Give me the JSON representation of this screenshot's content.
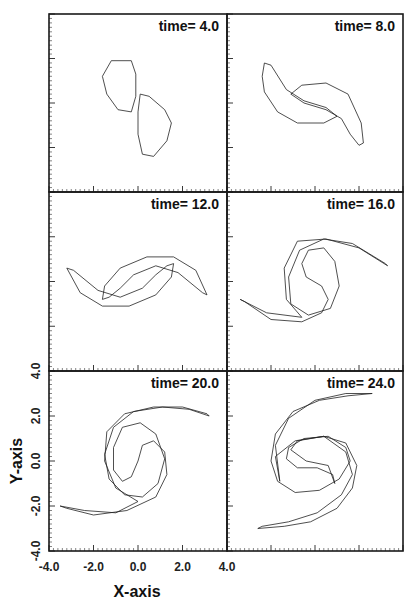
{
  "chart_data": {
    "type": "line",
    "xlabel": "X-axis",
    "ylabel": "Y-axis",
    "xlim": [
      -4.0,
      4.0
    ],
    "ylim": [
      -4.0,
      4.0
    ],
    "x_ticks": [
      "-4.0",
      "-2.0",
      "0.0",
      "2.0",
      "4.0"
    ],
    "y_ticks": [
      "-4.0",
      "-2.0",
      "0.0",
      "2.0",
      "4.0"
    ],
    "major_tick_step": 2.0,
    "minor_tick_step": 0.2,
    "grid": false,
    "panels": [
      {
        "title": "time=  4.0",
        "contours": [
          [
            [
              -1.2,
              1.9
            ],
            [
              -0.3,
              1.9
            ],
            [
              -0.1,
              1.3
            ],
            [
              -0.1,
              0.3
            ],
            [
              -0.3,
              -0.4
            ],
            [
              -0.9,
              -0.3
            ],
            [
              -1.4,
              0.4
            ],
            [
              -1.6,
              1.2
            ],
            [
              -1.2,
              1.9
            ]
          ],
          [
            [
              0.1,
              0.4
            ],
            [
              0.5,
              0.3
            ],
            [
              1.2,
              -0.3
            ],
            [
              1.5,
              -0.9
            ],
            [
              1.3,
              -1.7
            ],
            [
              0.7,
              -2.4
            ],
            [
              0.2,
              -2.3
            ],
            [
              0.0,
              -1.4
            ],
            [
              0.0,
              -0.4
            ],
            [
              0.1,
              0.4
            ]
          ]
        ]
      },
      {
        "title": "time=  8.0",
        "contours": [
          [
            [
              -2.3,
              1.8
            ],
            [
              -2.0,
              1.7
            ],
            [
              -1.3,
              0.6
            ],
            [
              -0.5,
              0.1
            ],
            [
              0.5,
              -0.2
            ],
            [
              1.0,
              -0.6
            ],
            [
              0.4,
              -0.9
            ],
            [
              -0.8,
              -0.9
            ],
            [
              -1.7,
              -0.4
            ],
            [
              -2.3,
              0.5
            ],
            [
              -2.4,
              1.2
            ],
            [
              -2.3,
              1.8
            ]
          ],
          [
            [
              2.0,
              -1.9
            ],
            [
              2.2,
              -1.8
            ],
            [
              2.1,
              -0.9
            ],
            [
              1.5,
              0.4
            ],
            [
              0.5,
              0.9
            ],
            [
              -0.6,
              0.8
            ],
            [
              -1.1,
              0.4
            ],
            [
              -0.5,
              0.0
            ],
            [
              0.5,
              -0.3
            ],
            [
              1.2,
              -0.7
            ],
            [
              1.6,
              -1.4
            ],
            [
              2.0,
              -1.9
            ]
          ]
        ]
      },
      {
        "title": "time=  12.0",
        "contours": [
          [
            [
              -3.2,
              0.6
            ],
            [
              -2.9,
              0.5
            ],
            [
              -1.8,
              -0.4
            ],
            [
              -0.8,
              -0.7
            ],
            [
              0.2,
              -0.3
            ],
            [
              0.8,
              0.3
            ],
            [
              1.3,
              0.7
            ],
            [
              1.6,
              0.8
            ],
            [
              1.5,
              0.2
            ],
            [
              0.8,
              -0.6
            ],
            [
              -0.4,
              -1.1
            ],
            [
              -1.6,
              -1.1
            ],
            [
              -2.6,
              -0.5
            ],
            [
              -3.2,
              0.6
            ]
          ],
          [
            [
              3.1,
              -0.6
            ],
            [
              2.9,
              -0.5
            ],
            [
              1.8,
              0.4
            ],
            [
              0.8,
              0.7
            ],
            [
              -0.2,
              0.3
            ],
            [
              -0.8,
              -0.3
            ],
            [
              -1.3,
              -0.7
            ],
            [
              -1.6,
              -0.8
            ],
            [
              -1.5,
              -0.2
            ],
            [
              -0.8,
              0.6
            ],
            [
              0.4,
              1.1
            ],
            [
              1.6,
              1.1
            ],
            [
              2.6,
              0.5
            ],
            [
              3.1,
              -0.6
            ]
          ]
        ]
      },
      {
        "title": "time=  16.0",
        "contours": [
          [
            [
              -3.4,
              -0.8
            ],
            [
              -3.2,
              -0.9
            ],
            [
              -2.0,
              -1.7
            ],
            [
              -0.6,
              -1.8
            ],
            [
              0.3,
              -1.4
            ],
            [
              0.6,
              -0.8
            ],
            [
              0.3,
              -0.2
            ],
            [
              -0.4,
              0.2
            ],
            [
              -0.6,
              0.8
            ],
            [
              -0.3,
              1.4
            ],
            [
              0.4,
              1.5
            ],
            [
              0.9,
              0.9
            ],
            [
              1.1,
              -0.2
            ],
            [
              0.7,
              -1.2
            ],
            [
              -0.3,
              -1.5
            ],
            [
              -1.1,
              -1.0
            ],
            [
              -1.2,
              0.2
            ],
            [
              -0.7,
              1.4
            ],
            [
              0.4,
              1.9
            ],
            [
              1.7,
              1.7
            ],
            [
              3.2,
              0.8
            ],
            [
              3.3,
              0.7
            ],
            [
              2.0,
              1.5
            ],
            [
              0.5,
              1.9
            ],
            [
              -0.8,
              1.8
            ],
            [
              -1.4,
              0.6
            ],
            [
              -1.3,
              -0.8
            ],
            [
              -0.6,
              -1.6
            ],
            [
              -2.2,
              -1.4
            ],
            [
              -3.4,
              -0.8
            ]
          ]
        ]
      },
      {
        "title": "time=  20.0",
        "contours": [
          [
            [
              -3.5,
              -2.0
            ],
            [
              -3.2,
              -2.1
            ],
            [
              -2.0,
              -2.4
            ],
            [
              -0.5,
              -2.2
            ],
            [
              0.8,
              -1.6
            ],
            [
              1.3,
              -0.6
            ],
            [
              1.2,
              0.4
            ],
            [
              0.7,
              0.9
            ],
            [
              0.2,
              0.7
            ],
            [
              0.0,
              0.0
            ],
            [
              -0.3,
              -0.7
            ],
            [
              -0.7,
              -0.9
            ],
            [
              -1.1,
              -0.4
            ],
            [
              -1.1,
              0.6
            ],
            [
              -0.7,
              1.5
            ],
            [
              0.1,
              1.7
            ],
            [
              0.8,
              1.2
            ],
            [
              1.2,
              0.1
            ],
            [
              0.9,
              -1.0
            ],
            [
              0.2,
              -1.6
            ],
            [
              -0.6,
              -1.5
            ],
            [
              -1.3,
              -0.8
            ],
            [
              -1.5,
              0.3
            ],
            [
              -1.1,
              1.5
            ],
            [
              -0.2,
              2.2
            ],
            [
              1.1,
              2.4
            ],
            [
              2.3,
              2.3
            ],
            [
              3.2,
              2.0
            ],
            [
              3.1,
              2.1
            ],
            [
              2.0,
              2.4
            ],
            [
              0.7,
              2.4
            ],
            [
              -0.6,
              2.1
            ],
            [
              -1.4,
              1.3
            ],
            [
              -1.5,
              0.0
            ],
            [
              -1.0,
              -1.2
            ],
            [
              0.0,
              -1.8
            ],
            [
              -1.0,
              -2.3
            ],
            [
              -2.4,
              -2.2
            ],
            [
              -3.5,
              -2.0
            ]
          ]
        ]
      },
      {
        "title": "time=  24.0",
        "contours": [
          [
            [
              2.6,
              3.0
            ],
            [
              1.5,
              2.9
            ],
            [
              0.2,
              2.7
            ],
            [
              -1.0,
              2.2
            ],
            [
              -1.8,
              1.2
            ],
            [
              -2.0,
              0.0
            ],
            [
              -1.7,
              -0.9
            ],
            [
              -0.9,
              -1.4
            ],
            [
              0.2,
              -1.3
            ],
            [
              1.1,
              -0.8
            ],
            [
              1.6,
              0.0
            ],
            [
              1.4,
              0.6
            ],
            [
              0.6,
              1.1
            ],
            [
              -0.5,
              1.0
            ],
            [
              -1.2,
              0.6
            ],
            [
              -1.3,
              0.1
            ],
            [
              -0.8,
              -0.3
            ],
            [
              0.1,
              -0.3
            ],
            [
              0.8,
              -0.6
            ],
            [
              0.9,
              -1.0
            ],
            [
              0.6,
              -0.2
            ],
            [
              -0.4,
              0.0
            ],
            [
              -1.1,
              0.5
            ],
            [
              -0.8,
              0.9
            ],
            [
              0.4,
              1.1
            ],
            [
              1.4,
              0.8
            ],
            [
              1.9,
              -0.2
            ],
            [
              1.7,
              -1.2
            ],
            [
              1.0,
              -2.1
            ],
            [
              -0.2,
              -2.7
            ],
            [
              -1.4,
              -2.9
            ],
            [
              -2.6,
              -3.0
            ],
            [
              -2.4,
              -2.9
            ],
            [
              -1.2,
              -2.7
            ],
            [
              0.1,
              -2.3
            ],
            [
              1.2,
              -1.5
            ],
            [
              1.7,
              -0.6
            ],
            [
              1.4,
              0.4
            ],
            [
              0.4,
              1.1
            ],
            [
              -0.9,
              0.9
            ],
            [
              -1.8,
              0.2
            ],
            [
              -1.6,
              -0.9
            ],
            [
              -1.8,
              0.7
            ],
            [
              -1.2,
              1.9
            ],
            [
              0.0,
              2.7
            ],
            [
              1.4,
              3.0
            ],
            [
              2.6,
              3.0
            ]
          ]
        ]
      }
    ]
  }
}
